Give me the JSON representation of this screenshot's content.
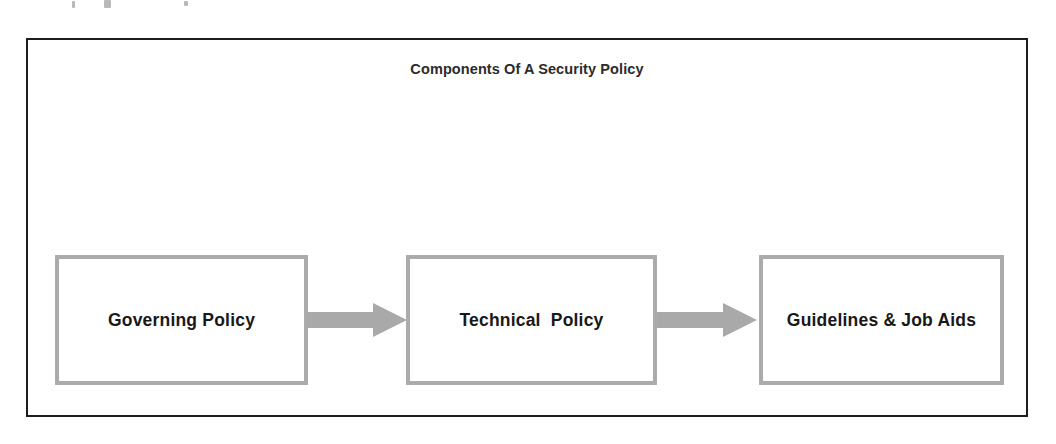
{
  "document": {
    "background_color": "#ffffff",
    "frame_border_color": "#1d1d1d"
  },
  "diagram": {
    "title": "Components Of A Security Policy",
    "type": "flowchart",
    "direction": "left-to-right",
    "box_border_color": "#ababab",
    "box_fill_color": "#ffffff",
    "arrow_color": "#a9a9a9",
    "text_color": "#181818",
    "nodes": [
      {
        "id": "governing-policy",
        "label": "Governing Policy",
        "order": 1
      },
      {
        "id": "technical-policy",
        "label": "Technical  Policy",
        "order": 2
      },
      {
        "id": "guidelines-job-aids",
        "label": "Guidelines & Job Aids",
        "order": 3
      }
    ],
    "connectors": [
      {
        "id": "arrow-1",
        "from": "governing-policy",
        "to": "technical-policy",
        "shape": "block-arrow-right"
      },
      {
        "id": "arrow-2",
        "from": "technical-policy",
        "to": "guidelines-job-aids",
        "shape": "block-arrow-right"
      }
    ]
  }
}
